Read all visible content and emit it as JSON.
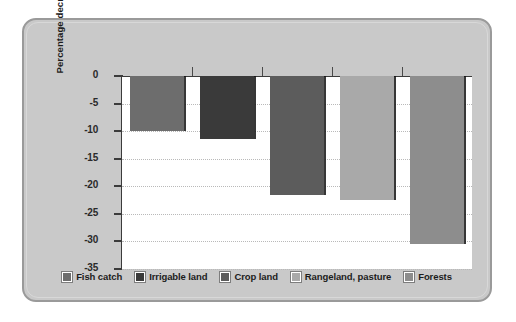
{
  "chart_data": {
    "type": "bar",
    "title": "",
    "xlabel": "",
    "ylabel": "Percentage decrease",
    "ylim": [
      -35,
      0
    ],
    "ytick_labels": [
      "0",
      "-5",
      "-10",
      "-15",
      "-20",
      "-25",
      "-30",
      "-35"
    ],
    "ytick_values": [
      0,
      -5,
      -10,
      -15,
      -20,
      -25,
      -30,
      -35
    ],
    "grid": true,
    "legend_position": "bottom",
    "categories": [
      "Fish catch",
      "Irrigable land",
      "Crop land",
      "Rangeland, pasture",
      "Forests"
    ],
    "values": [
      -10,
      -11.5,
      -21.5,
      -22.5,
      -30.5
    ],
    "colors": [
      "#6d6d6d",
      "#3a3a3a",
      "#5c5c5c",
      "#a9a9a9",
      "#8d8d8d"
    ],
    "series": [
      {
        "name": "Percentage decrease",
        "points": [
          {
            "category": "Fish catch",
            "value": -10,
            "color": "#6d6d6d"
          },
          {
            "category": "Irrigable land",
            "value": -11.5,
            "color": "#3a3a3a"
          },
          {
            "category": "Crop land",
            "value": -21.5,
            "color": "#5c5c5c"
          },
          {
            "category": "Rangeland, pasture",
            "value": -22.5,
            "color": "#a9a9a9"
          },
          {
            "category": "Forests",
            "value": -30.5,
            "color": "#8d8d8d"
          }
        ]
      }
    ]
  },
  "legend": {
    "items": [
      {
        "label": "Fish catch",
        "color": "#6d6d6d"
      },
      {
        "label": "Irrigable land",
        "color": "#3a3a3a"
      },
      {
        "label": "Crop land",
        "color": "#5c5c5c"
      },
      {
        "label": "Rangeland, pasture",
        "color": "#a9a9a9"
      },
      {
        "label": "Forests",
        "color": "#8d8d8d"
      }
    ]
  },
  "panel": {
    "background_color": "#c9c9c9",
    "border_color": "#9a9a9a",
    "plot_background_color": "#ffffff"
  }
}
